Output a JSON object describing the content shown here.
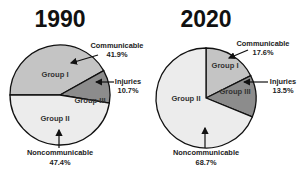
{
  "chart_data": [
    {
      "type": "pie",
      "title": "1990",
      "slices": [
        {
          "name": "Group I",
          "category": "Communicable",
          "value": 41.9,
          "color": "#c4c4c4"
        },
        {
          "name": "Group III",
          "category": "Injuries",
          "value": 10.7,
          "color": "#8c8c8c"
        },
        {
          "name": "Group II",
          "category": "Noncommunicable",
          "value": 47.4,
          "color": "#ececec"
        }
      ],
      "annotations": [
        {
          "label": "Communicable",
          "value_text": "41.9%"
        },
        {
          "label": "Injuries",
          "value_text": "10.7%"
        },
        {
          "label": "Noncommunicable",
          "value_text": "47.4%"
        }
      ]
    },
    {
      "type": "pie",
      "title": "2020",
      "slices": [
        {
          "name": "Group I",
          "category": "Communicable",
          "value": 17.6,
          "color": "#c4c4c4"
        },
        {
          "name": "Group III",
          "category": "Injuries",
          "value": 13.5,
          "color": "#8c8c8c"
        },
        {
          "name": "Group II",
          "category": "Noncommunicable",
          "value": 68.7,
          "color": "#ececec"
        }
      ],
      "annotations": [
        {
          "label": "Communicable",
          "value_text": "17.6%"
        },
        {
          "label": "Injuries",
          "value_text": "13.5%"
        },
        {
          "label": "Noncommunicable",
          "value_text": "68.7%"
        }
      ]
    }
  ]
}
